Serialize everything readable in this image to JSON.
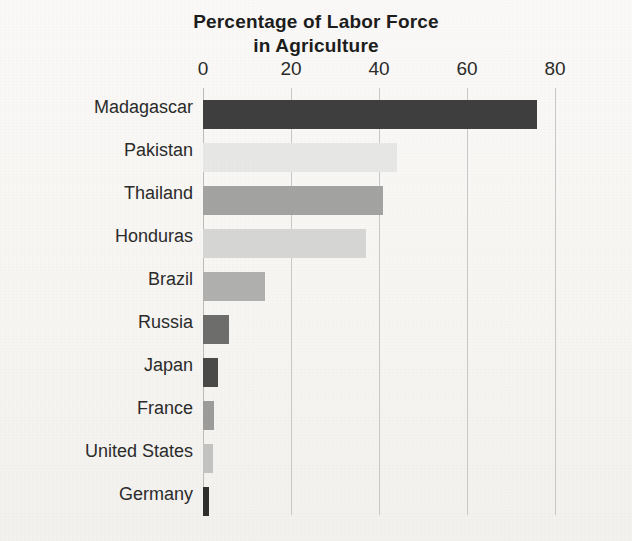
{
  "chart_data": {
    "type": "bar",
    "orientation": "horizontal",
    "title": "Percentage of Labor Force in Agriculture",
    "title_lines": [
      "Percentage of Labor Force",
      "in Agriculture"
    ],
    "xlabel": "",
    "ylabel": "",
    "xlim": [
      0,
      80
    ],
    "ylim": null,
    "grid": true,
    "grid_axis": "x",
    "legend": false,
    "legend_position": "none",
    "xticks": [
      0,
      20,
      40,
      60,
      80
    ],
    "xtick_labels": [
      "0",
      "20",
      "40",
      "60",
      "80"
    ],
    "categories": [
      "Madagascar",
      "Pakistan",
      "Thailand",
      "Honduras",
      "Brazil",
      "Russia",
      "Japan",
      "France",
      "United States",
      "Germany"
    ],
    "values": [
      76,
      44,
      41,
      37,
      14,
      6,
      3.5,
      2.5,
      2.2,
      1.3
    ],
    "bar_colors": [
      "#3f3f3f",
      "#e7e7e6",
      "#a3a3a2",
      "#d6d6d5",
      "#b0b0af",
      "#6d6d6c",
      "#4a4a49",
      "#9c9c9b",
      "#c3c3c2",
      "#2f2f2e"
    ],
    "bars": [
      {
        "category": "Madagascar",
        "value": 76,
        "color": "#3f3f3f"
      },
      {
        "category": "Pakistan",
        "value": 44,
        "color": "#e7e7e6"
      },
      {
        "category": "Thailand",
        "value": 41,
        "color": "#a3a3a2"
      },
      {
        "category": "Honduras",
        "value": 37,
        "color": "#d6d6d5"
      },
      {
        "category": "Brazil",
        "value": 14,
        "color": "#b0b0af"
      },
      {
        "category": "Russia",
        "value": 6,
        "color": "#6d6d6c"
      },
      {
        "category": "Japan",
        "value": 3.5,
        "color": "#4a4a49"
      },
      {
        "category": "France",
        "value": 2.5,
        "color": "#9c9c9b"
      },
      {
        "category": "United States",
        "value": 2.2,
        "color": "#c3c3c2"
      },
      {
        "category": "Germany",
        "value": 1.3,
        "color": "#2f2f2e"
      }
    ]
  },
  "style": {
    "background_color": "#f7f6f3",
    "text_color": "#2b2b2b",
    "title_color": "#1d1d1d",
    "gridline_color": "#c9c8c6"
  }
}
